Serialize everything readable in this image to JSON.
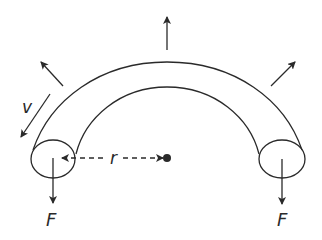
{
  "diagram": {
    "labels": {
      "velocity": "v",
      "radius": "r",
      "force_left": "F",
      "force_right": "F"
    },
    "elements": [
      {
        "name": "tube",
        "shape": "semicircular-tube"
      },
      {
        "name": "center",
        "shape": "dot"
      },
      {
        "name": "radius-line",
        "shape": "dashed-arrow",
        "label": "r"
      },
      {
        "name": "radial-arrows",
        "count": 3,
        "direction": "outward"
      },
      {
        "name": "force-arrows",
        "count": 2,
        "direction": "down",
        "label": "F"
      },
      {
        "name": "velocity-arrow",
        "label": "v"
      }
    ],
    "colors": {
      "stroke": "#2a2a2a",
      "background": "#ffffff"
    }
  }
}
